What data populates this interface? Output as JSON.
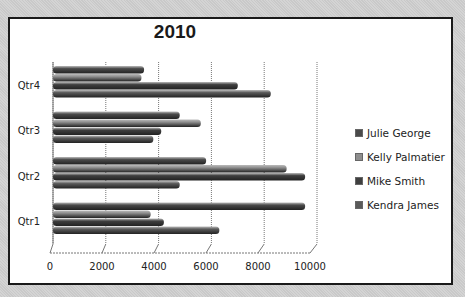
{
  "chart_data": {
    "type": "bar",
    "orientation": "horizontal",
    "style": "3d-clustered-cylinder",
    "title": "2010",
    "xlabel": "",
    "ylabel": "",
    "categories": [
      "Qtr1",
      "Qtr2",
      "Qtr3",
      "Qtr4"
    ],
    "series": [
      {
        "name": "Julie George",
        "values": [
          9550,
          5800,
          4800,
          3450
        ],
        "color": "#4a4a4a"
      },
      {
        "name": "Kelly Palmatier",
        "values": [
          3700,
          8850,
          5600,
          3350
        ],
        "color": "#8e8e8e"
      },
      {
        "name": "Mike Smith",
        "values": [
          4200,
          9550,
          4100,
          7000
        ],
        "color": "#3f3f3f"
      },
      {
        "name": "Kendra James",
        "values": [
          6300,
          4800,
          3800,
          8250
        ],
        "color": "#5a5a5a"
      }
    ],
    "xlim": [
      0,
      10000
    ],
    "x_ticks": [
      "0",
      "2000",
      "4000",
      "6000",
      "8000",
      "10000"
    ],
    "grid": true,
    "legend_position": "right"
  }
}
